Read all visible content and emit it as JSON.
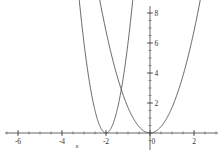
{
  "chart_data": {
    "type": "line",
    "title": "",
    "subtitle": "",
    "xlabel": "x",
    "ylabel": "",
    "xlim": [
      -6.6,
      3.2
    ],
    "ylim": [
      -0.6,
      9.0
    ],
    "grid": false,
    "legend": "none",
    "x_ticks": [
      {
        "value": -6,
        "label": "-6"
      },
      {
        "value": -4,
        "label": "-4"
      },
      {
        "value": -2,
        "label": "-2"
      },
      {
        "value": 0,
        "label": "0"
      },
      {
        "value": 2,
        "label": "2"
      }
    ],
    "y_ticks": [
      {
        "value": 2,
        "label": "2"
      },
      {
        "value": 4,
        "label": "4"
      },
      {
        "value": 6,
        "label": "6"
      },
      {
        "value": 8,
        "label": "8"
      }
    ],
    "x_minor_tick_step": 0.5,
    "y_minor_tick_step": 0.5,
    "series": [
      {
        "name": "narrow-parabola-vertex-minus-two",
        "style": "solid",
        "color": "#4a4a4a",
        "vertex": [
          -2,
          0
        ],
        "coefficient": 6.0,
        "equation": "y = 6(x + 2)^2",
        "x": [
          -3.2,
          -3.0,
          -2.8,
          -2.6,
          -2.4,
          -2.2,
          -2.0,
          -1.8,
          -1.6,
          -1.4,
          -1.2,
          -1.0,
          -0.8,
          -0.6
        ],
        "values": [
          8.64,
          6.0,
          3.84,
          2.16,
          0.96,
          0.24,
          0.0,
          0.24,
          0.96,
          2.16,
          3.84,
          6.0,
          8.64,
          11.76
        ]
      },
      {
        "name": "parabola-vertex-origin",
        "style": "solid",
        "color": "#4a4a4a",
        "vertex": [
          0,
          0
        ],
        "coefficient": 1.7,
        "equation": "y = 1.7x^2",
        "x": [
          -2.3,
          -2.0,
          -1.6,
          -1.2,
          -0.8,
          -0.4,
          0.0,
          0.4,
          0.8,
          1.2,
          1.6,
          2.0,
          2.3
        ],
        "values": [
          8.99,
          6.8,
          4.35,
          2.45,
          1.09,
          0.27,
          0.0,
          0.27,
          1.09,
          2.45,
          4.35,
          6.8,
          8.99
        ]
      },
      {
        "name": "wide-dashed-parabola-vertex-minus-two",
        "style": "dashed",
        "color": "#4a4a4a",
        "vertex": [
          -2,
          0
        ],
        "coefficient": 1.2,
        "equation": "y = 1.2(x + 2)^2",
        "x": [
          -4.8,
          -4.4,
          -4.0,
          -3.6,
          -3.2,
          -2.8,
          -2.4,
          -2.0,
          -1.6,
          -1.2,
          -0.8,
          -0.4,
          0.0,
          0.4,
          0.7
        ],
        "values": [
          9.41,
          6.91,
          4.8,
          3.07,
          1.73,
          0.77,
          0.19,
          0.0,
          0.19,
          0.77,
          1.73,
          3.07,
          4.8,
          6.91,
          8.64
        ]
      }
    ],
    "annotations": []
  },
  "axis": {
    "x_axis_name": "x-axis",
    "y_axis_name": "y-axis"
  }
}
